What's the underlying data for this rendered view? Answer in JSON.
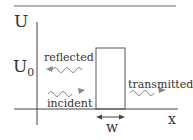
{
  "diagram": {
    "type": "quantum-tunneling-potential-barrier",
    "y_axis_label": "U",
    "barrier_height_label": "U",
    "barrier_height_subscript": "0",
    "x_axis_label": "x",
    "width_label": "w",
    "waves": {
      "reflected": "reflected",
      "incident": "incident",
      "transmitted": "transmitted"
    },
    "colors": {
      "lines": "#444444",
      "waves": "#888888",
      "text": "#333333"
    }
  }
}
